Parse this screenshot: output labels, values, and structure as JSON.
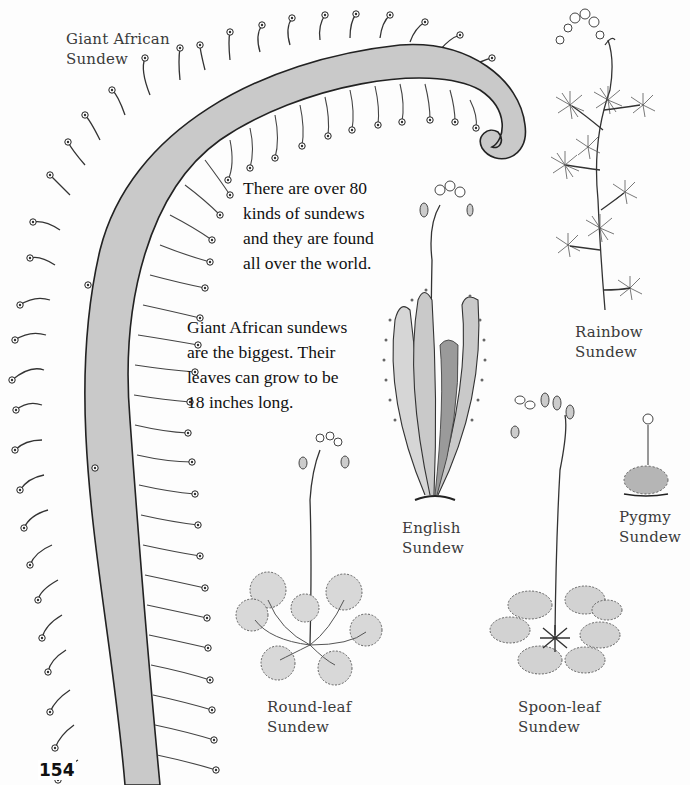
{
  "page": {
    "number": "154",
    "background": "#fdfdfd",
    "leaf_fill": "#c9c9c9",
    "ink": "#222222"
  },
  "captions": {
    "giant_african": {
      "lines": [
        "Giant African",
        "Sundew"
      ]
    },
    "rainbow": {
      "lines": [
        "Rainbow",
        "Sundew"
      ]
    },
    "english": {
      "lines": [
        "English",
        "Sundew"
      ]
    },
    "pygmy": {
      "lines": [
        "Pygmy",
        "Sundew"
      ]
    },
    "round_leaf": {
      "lines": [
        "Round-leaf",
        "Sundew"
      ]
    },
    "spoon_leaf": {
      "lines": [
        "Spoon-leaf",
        "Sundew"
      ]
    }
  },
  "paragraphs": {
    "intro": {
      "lines": [
        "There are over 80",
        "kinds of sundews",
        "and they are found",
        "all over the world."
      ]
    },
    "giant_fact": {
      "lines": [
        "Giant African sundews",
        "are the biggest. Their",
        "leaves can grow to be",
        "18 inches long."
      ]
    }
  },
  "illustrations": [
    {
      "name": "giant-african-sundew",
      "label": "Giant African Sundew"
    },
    {
      "name": "rainbow-sundew",
      "label": "Rainbow Sundew"
    },
    {
      "name": "english-sundew",
      "label": "English Sundew"
    },
    {
      "name": "pygmy-sundew",
      "label": "Pygmy Sundew"
    },
    {
      "name": "round-leaf-sundew",
      "label": "Round-leaf Sundew"
    },
    {
      "name": "spoon-leaf-sundew",
      "label": "Spoon-leaf Sundew"
    }
  ]
}
